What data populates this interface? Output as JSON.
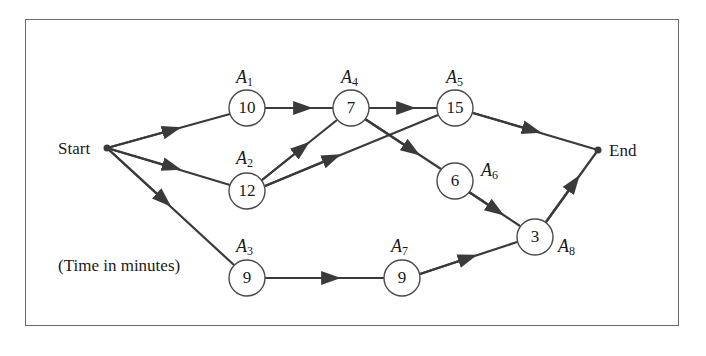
{
  "diagram": {
    "type": "activity-network",
    "start_label": "Start",
    "end_label": "End",
    "note": "(Time in minutes)",
    "nodes": [
      {
        "id": "A1",
        "letter": "A",
        "sub": "1",
        "time": "10"
      },
      {
        "id": "A2",
        "letter": "A",
        "sub": "2",
        "time": "12"
      },
      {
        "id": "A3",
        "letter": "A",
        "sub": "3",
        "time": "9"
      },
      {
        "id": "A4",
        "letter": "A",
        "sub": "4",
        "time": "7"
      },
      {
        "id": "A5",
        "letter": "A",
        "sub": "5",
        "time": "15"
      },
      {
        "id": "A6",
        "letter": "A",
        "sub": "6",
        "time": "6"
      },
      {
        "id": "A7",
        "letter": "A",
        "sub": "7",
        "time": "9"
      },
      {
        "id": "A8",
        "letter": "A",
        "sub": "8",
        "time": "3"
      }
    ],
    "edges": [
      [
        "Start",
        "A1"
      ],
      [
        "Start",
        "A2"
      ],
      [
        "Start",
        "A3"
      ],
      [
        "A1",
        "A4"
      ],
      [
        "A2",
        "A4"
      ],
      [
        "A2",
        "A5"
      ],
      [
        "A4",
        "A5"
      ],
      [
        "A4",
        "A6"
      ],
      [
        "A5",
        "End"
      ],
      [
        "A6",
        "A8"
      ],
      [
        "A3",
        "A7"
      ],
      [
        "A7",
        "A8"
      ],
      [
        "A8",
        "End"
      ]
    ],
    "colors": {
      "line": "#3a3a3a",
      "frame": "#6a6a6a",
      "text": "#1a1a1a"
    }
  }
}
